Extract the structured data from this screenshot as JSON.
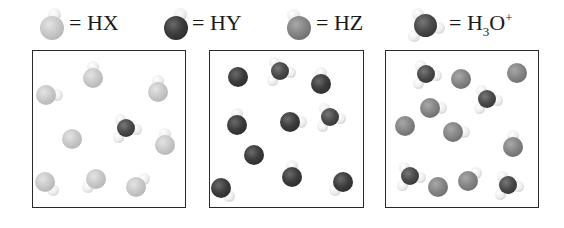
{
  "legend": [
    {
      "id": "HX",
      "label_main": "= HX",
      "icon": "hx-molecule-icon"
    },
    {
      "id": "HY",
      "label_main": "= HY",
      "icon": "hy-molecule-icon"
    },
    {
      "id": "HZ",
      "label_main": "= HZ",
      "icon": "hz-molecule-icon"
    },
    {
      "id": "H3O+",
      "label_prefix": "= H",
      "label_sub": "3",
      "label_mid": "O",
      "label_sup": "+",
      "icon": "hydronium-icon"
    }
  ],
  "boxes": [
    {
      "name": "HX solution",
      "contents": {
        "HX": 8,
        "H3O+": 1
      }
    },
    {
      "name": "HY solution",
      "contents": {
        "HY": 8,
        "H3O+": 2
      }
    },
    {
      "name": "HZ solution",
      "contents": {
        "HZ": 8,
        "H3O+": 4
      }
    }
  ],
  "colors": {
    "HX": "#c8c8c8",
    "HY": "#3c3c3c",
    "HZ": "#858585",
    "O": "#4a4a4a",
    "H": "#ededed",
    "border": "#2a2a2a"
  }
}
